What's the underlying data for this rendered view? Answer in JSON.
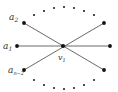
{
  "diagram": {
    "type": "graph",
    "center_vertex": {
      "id": "v1",
      "label": "v",
      "subscript": "1"
    },
    "labels": [
      {
        "id": "a2",
        "base": "a",
        "subscript": "2"
      },
      {
        "id": "a1",
        "base": "a",
        "subscript": "1"
      },
      {
        "id": "an-2",
        "base": "a",
        "subscript": "n−2"
      }
    ],
    "outer_vertices": [
      "a2",
      "a1",
      "an-2",
      "right-top",
      "right-mid",
      "right-bottom"
    ],
    "edges": [
      [
        "a2",
        "right-bottom"
      ],
      [
        "a1",
        "right-mid"
      ],
      [
        "an-2",
        "right-top"
      ]
    ],
    "top_ellipsis_dots": 7,
    "bottom_ellipsis_dots": 7,
    "colors": {
      "line": "#444444",
      "vertex": "#111111",
      "label": "#333333"
    }
  }
}
